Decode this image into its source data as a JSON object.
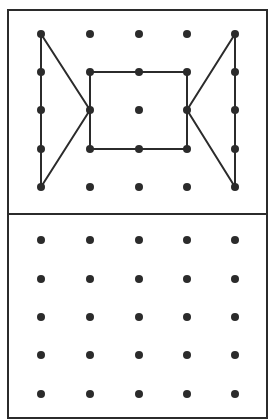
{
  "diagram": {
    "type": "geoboard",
    "colors": {
      "line": "#2b2b2b",
      "dot": "#2b2b2b",
      "background": "#ffffff"
    },
    "frame": {
      "x": 8,
      "y": 10,
      "width": 259,
      "height": 408,
      "divider_y": 214
    },
    "grid_columns_x": [
      41,
      90,
      139,
      187,
      235
    ],
    "top_grid": {
      "rows_y": [
        34,
        72,
        110,
        149,
        187
      ],
      "shape": {
        "description": "Square in center with two triangles pointing inward from left and right edges (bow-tie/butterfly figure)",
        "segments": [
          [
            [
              0,
              0
            ],
            [
              0,
              4
            ]
          ],
          [
            [
              0,
              0
            ],
            [
              1,
              2
            ]
          ],
          [
            [
              0,
              4
            ],
            [
              1,
              2
            ]
          ],
          [
            [
              1,
              1
            ],
            [
              3,
              1
            ]
          ],
          [
            [
              3,
              1
            ],
            [
              3,
              3
            ]
          ],
          [
            [
              3,
              3
            ],
            [
              1,
              3
            ]
          ],
          [
            [
              1,
              3
            ],
            [
              1,
              1
            ]
          ],
          [
            [
              4,
              0
            ],
            [
              4,
              4
            ]
          ],
          [
            [
              4,
              0
            ],
            [
              3,
              2
            ]
          ],
          [
            [
              4,
              4
            ],
            [
              3,
              2
            ]
          ]
        ]
      }
    },
    "bottom_grid": {
      "rows_y": [
        240,
        279,
        317,
        355,
        394
      ],
      "shape": null
    }
  }
}
